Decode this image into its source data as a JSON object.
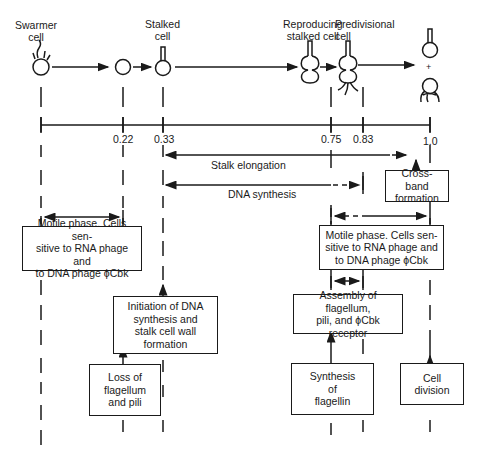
{
  "stages": [
    {
      "label": "Swarmer\ncell",
      "x": 41
    },
    {
      "label": "Stalked\ncell",
      "x": 163
    },
    {
      "label": "Reproducing\nstalked cell",
      "x": 310
    },
    {
      "label": "Predivisional\ncell",
      "x": 363
    }
  ],
  "timeline": {
    "ticks": [
      "0.22",
      "0.33",
      "0.75",
      "0.83",
      "1.0"
    ]
  },
  "phases": {
    "stalk_elongation": "Stalk elongation",
    "dna_synthesis": "DNA synthesis"
  },
  "boxes": {
    "cross_band": "Cross-band\nformation",
    "motile_left": "Motile phase. Cells sen-\nsitive to RNA phage and\nto DNA phage ϕCbk",
    "motile_right": "Motile phase. Cells sen-\nsitive to RNA phage and\nto DNA phage ϕCbk",
    "initiation": "Initiation of DNA\nsynthesis and\nstalk cell wall\nformation",
    "assembly": "Assembly of flagellum,\npili, and ϕCbk\nreceptor",
    "loss": "Loss of\nflagellum\nand pili",
    "synthesis": "Synthesis\nof\nflagellin",
    "division": "Cell\ndivision"
  },
  "plus_sign": "+"
}
